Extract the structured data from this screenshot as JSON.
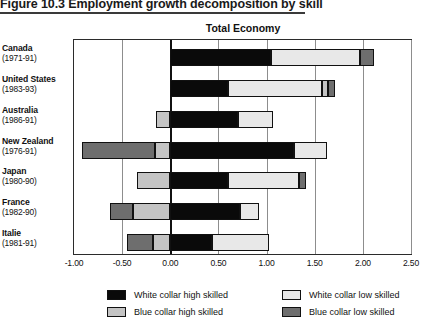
{
  "figure": {
    "caption": "Figure 10.3  Employment growth decomposition by skill"
  },
  "chart_data": {
    "type": "bar",
    "orientation": "horizontal",
    "stacked": true,
    "title": "Total Economy",
    "xlabel": "",
    "ylabel": "",
    "xlim": [
      -1.0,
      2.5
    ],
    "xticks": [
      "-1.00",
      "-0.50",
      "0.00",
      "0.50",
      "1.00",
      "1.50",
      "2.00",
      "2.50"
    ],
    "xtick_values": [
      -1.0,
      -0.5,
      0.0,
      0.5,
      1.0,
      1.5,
      2.0,
      2.5
    ],
    "grid": true,
    "legend_position": "bottom",
    "categories": [
      {
        "name": "Canada",
        "years": "(1971-91)"
      },
      {
        "name": "United States",
        "years": "(1983-93)"
      },
      {
        "name": "Australia",
        "years": "(1986-91)"
      },
      {
        "name": "New Zealand",
        "years": "(1976-91)"
      },
      {
        "name": "Japan",
        "years": "(1980-90)"
      },
      {
        "name": "France",
        "years": "(1982-90)"
      },
      {
        "name": "Italie",
        "years": "(1981-91)"
      }
    ],
    "series": [
      {
        "name": "White collar high skilled",
        "key": "wh",
        "color": "#0a0a0a",
        "values": [
          1.05,
          0.6,
          0.7,
          1.28,
          0.6,
          0.72,
          0.43
        ]
      },
      {
        "name": "White collar low skilled",
        "key": "wl",
        "color": "#e8e8e8",
        "values": [
          0.92,
          0.98,
          0.37,
          0.35,
          0.74,
          0.2,
          0.6
        ]
      },
      {
        "name": "Blue collar high skilled",
        "key": "bh",
        "color": "#c4c4c4",
        "values": [
          0.0,
          0.06,
          -0.15,
          -0.16,
          -0.35,
          -0.39,
          -0.18
        ]
      },
      {
        "name": "Blue collar low skilled",
        "key": "bl",
        "color": "#6e6e6e",
        "values": [
          0.15,
          0.07,
          0.0,
          -0.76,
          0.07,
          -0.24,
          -0.27
        ]
      }
    ],
    "totals": [
      2.12,
      1.71,
      0.92,
      0.71,
      1.06,
      0.29,
      0.58
    ]
  },
  "legend": [
    {
      "label": "White collar high skilled",
      "color": "#0a0a0a"
    },
    {
      "label": "White collar low skilled",
      "color": "#e8e8e8"
    },
    {
      "label": "Blue collar high skilled",
      "color": "#c4c4c4"
    },
    {
      "label": "Blue collar low skilled",
      "color": "#6e6e6e"
    }
  ]
}
